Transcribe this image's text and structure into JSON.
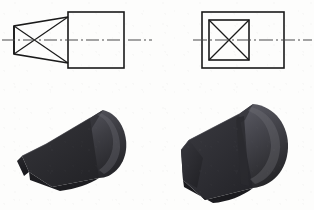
{
  "figure": {
    "background_color": "#fdfdfc",
    "line_color": "#1a1a1a",
    "centerline_color": "#4a4a4a",
    "panels": [
      {
        "id": "drawing-left",
        "label": "Left orthographic view: tapered wedge with square body",
        "kind": "orthographic-drawing"
      },
      {
        "id": "drawing-right",
        "label": "Right orthographic view: square end face on rectangular body",
        "kind": "orthographic-drawing"
      },
      {
        "id": "solid-left",
        "label": "Left 3D solid: tapered chamfered wedge nose on cylinder",
        "kind": "solid-model"
      },
      {
        "id": "solid-right",
        "label": "Right 3D solid: cylinder with flat faceted chamfered end",
        "kind": "solid-model"
      }
    ],
    "geometry": {
      "drawing_left": {
        "body_rect": {
          "x": 68,
          "y": 12,
          "w": 56,
          "h": 56
        },
        "taper_left_edge": {
          "x": 14,
          "y_top": 26,
          "y_bottom": 54
        },
        "taper_right_top_y": 17,
        "taper_right_bottom_y": 63,
        "taper_right_x": 68,
        "centerline": {
          "y": 40,
          "x_start": 2,
          "x_end": 152
        },
        "has_diagonal_cross": true
      },
      "drawing_right": {
        "body_rect": {
          "x": 45,
          "y": 12,
          "w": 82,
          "h": 56
        },
        "inner_square": {
          "x": 52,
          "y": 20,
          "w": 40,
          "h": 40
        },
        "centerline": {
          "y": 40,
          "x_start": 36,
          "x_end": 155
        },
        "has_diagonal_cross": true
      }
    },
    "solid_shading": {
      "dark": "#2b2b2f",
      "mid": "#3e3e44",
      "light": "#55555c",
      "highlight": "#6a6a72",
      "shadow": "#1c1c20"
    }
  }
}
